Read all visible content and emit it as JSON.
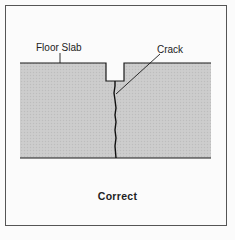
{
  "diagram": {
    "labels": {
      "floor_slab": "Floor Slab",
      "crack": "Crack"
    },
    "caption": "Correct",
    "colors": {
      "slab_fill": "#c8c8c8",
      "line": "#1a1a1a",
      "frame": "#555555",
      "background": "#fbfbfb"
    }
  }
}
